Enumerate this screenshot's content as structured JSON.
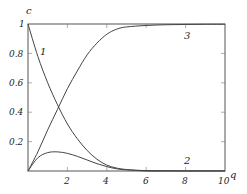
{
  "chart_data": {
    "type": "line",
    "title": "",
    "xlabel": "q",
    "ylabel": "c",
    "xlim": [
      0,
      10
    ],
    "ylim": [
      0,
      1
    ],
    "grid": false,
    "legend": "none (curves labeled inline 1, 2, 3)",
    "x_ticks": [
      "2",
      "4",
      "6",
      "8",
      "10"
    ],
    "y_ticks": [
      "0.2",
      "0.4",
      "0.6",
      "0.8",
      "1"
    ],
    "series": [
      {
        "name": "1",
        "x": [
          0,
          0.5,
          1,
          1.5,
          2,
          2.5,
          3,
          3.5,
          4,
          4.5,
          5,
          6,
          7,
          8,
          9,
          10
        ],
        "values": [
          1.0,
          0.78,
          0.6,
          0.45,
          0.32,
          0.22,
          0.14,
          0.08,
          0.04,
          0.02,
          0.01,
          0.0,
          0.0,
          0.0,
          0.0,
          0.0
        ]
      },
      {
        "name": "2",
        "x": [
          0,
          0.5,
          1,
          1.5,
          2,
          2.5,
          3,
          3.5,
          4,
          4.5,
          5,
          6,
          7,
          8,
          9,
          10
        ],
        "values": [
          0.0,
          0.09,
          0.125,
          0.13,
          0.12,
          0.1,
          0.075,
          0.05,
          0.03,
          0.015,
          0.008,
          0.003,
          0.002,
          0.001,
          0.001,
          0.001
        ]
      },
      {
        "name": "3",
        "x": [
          0,
          0.5,
          1,
          1.5,
          2,
          2.5,
          3,
          3.5,
          4,
          4.5,
          5,
          6,
          7,
          8,
          9,
          10
        ],
        "values": [
          0.0,
          0.13,
          0.28,
          0.42,
          0.56,
          0.68,
          0.79,
          0.87,
          0.93,
          0.965,
          0.98,
          0.99,
          0.995,
          0.997,
          0.998,
          0.998
        ]
      }
    ],
    "annotations": [
      {
        "text": "1",
        "x": 0.8,
        "y": 0.82
      },
      {
        "text": "2",
        "x": 8.0,
        "y": 0.05
      },
      {
        "text": "3",
        "x": 8.0,
        "y": 0.94
      }
    ]
  },
  "labels": {
    "xlabel": "q",
    "ylabel": "c",
    "curve1": "1",
    "curve2": "2",
    "curve3": "3",
    "xticks": [
      "2",
      "4",
      "6",
      "8",
      "10"
    ],
    "yticks": [
      "0.2",
      "0.4",
      "0.6",
      "0.8",
      "1"
    ]
  }
}
